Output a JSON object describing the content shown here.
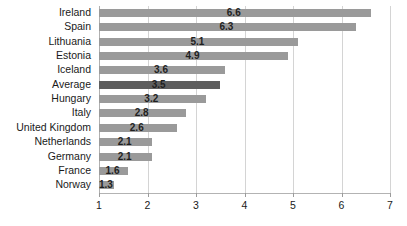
{
  "chart_data": {
    "type": "bar",
    "orientation": "horizontal",
    "title": "",
    "xlabel": "",
    "ylabel": "",
    "xlim": [
      1,
      7
    ],
    "xticks": [
      1,
      2,
      3,
      4,
      5,
      6,
      7
    ],
    "grid": true,
    "legend": false,
    "categories": [
      "Ireland",
      "Spain",
      "Lithuania",
      "Estonia",
      "Iceland",
      "Average",
      "Hungary",
      "Italy",
      "United Kingdom",
      "Netherlands",
      "Germany",
      "France",
      "Norway"
    ],
    "values": [
      6.6,
      6.3,
      5.1,
      4.9,
      3.6,
      3.5,
      3.2,
      2.8,
      2.6,
      2.1,
      2.1,
      1.6,
      1.3
    ],
    "value_labels": [
      "6.6",
      "6.3",
      "5.1",
      "4.9",
      "3.6",
      "3.5",
      "3.2",
      "2.8",
      "2.6",
      "2.1",
      "2.1",
      "1.6",
      "1.3"
    ],
    "highlight_category": "Average",
    "colors": {
      "bar": "#9a9a9a",
      "bar_highlight": "#5e5e5e",
      "gridline": "#d4d4d4",
      "axis": "#b0b0b0",
      "text": "#1a1a1a"
    }
  }
}
